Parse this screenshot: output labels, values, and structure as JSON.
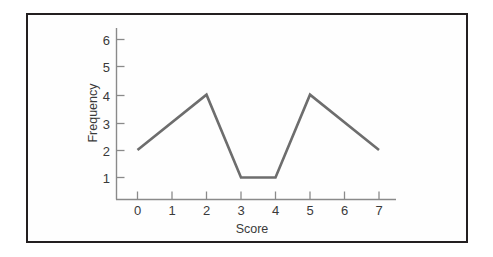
{
  "figure": {
    "background_color": "#ffffff",
    "frame_color": "#231f20",
    "plot_background": "#fefefe"
  },
  "chart_data": {
    "type": "line",
    "title": "",
    "subtitle": "",
    "xlabel": "Score",
    "ylabel": "Frequency",
    "x": [
      0,
      1,
      2,
      3,
      4,
      5,
      6,
      7
    ],
    "values": [
      2,
      3,
      4,
      1,
      1,
      4,
      3,
      2
    ],
    "vertices": [
      {
        "x": 0,
        "y": 2
      },
      {
        "x": 2,
        "y": 4
      },
      {
        "x": 3,
        "y": 1
      },
      {
        "x": 4,
        "y": 1
      },
      {
        "x": 5,
        "y": 4
      },
      {
        "x": 7,
        "y": 2
      }
    ],
    "xticklabels": [
      "0",
      "1",
      "2",
      "3",
      "4",
      "5",
      "6",
      "7"
    ],
    "yticklabels": [
      "1",
      "2",
      "3",
      "4",
      "5",
      "6"
    ],
    "yticks": [
      1,
      2,
      3,
      4,
      5,
      6
    ],
    "xlim": [
      0,
      7
    ],
    "ylim": [
      0,
      6.5
    ],
    "grid": false,
    "legend": null,
    "legend_position": "none",
    "line_color": "#6d6d6d",
    "axis_color": "#8a8a8a",
    "text_color": "#3a3a3a",
    "markers": false,
    "annotations": []
  },
  "axes": {
    "x_axis_label": "Score",
    "y_axis_label": "Frequency",
    "x_tick_labels": [
      "0",
      "1",
      "2",
      "3",
      "4",
      "5",
      "6",
      "7"
    ],
    "y_tick_labels": [
      "1",
      "2",
      "3",
      "4",
      "5",
      "6"
    ]
  }
}
